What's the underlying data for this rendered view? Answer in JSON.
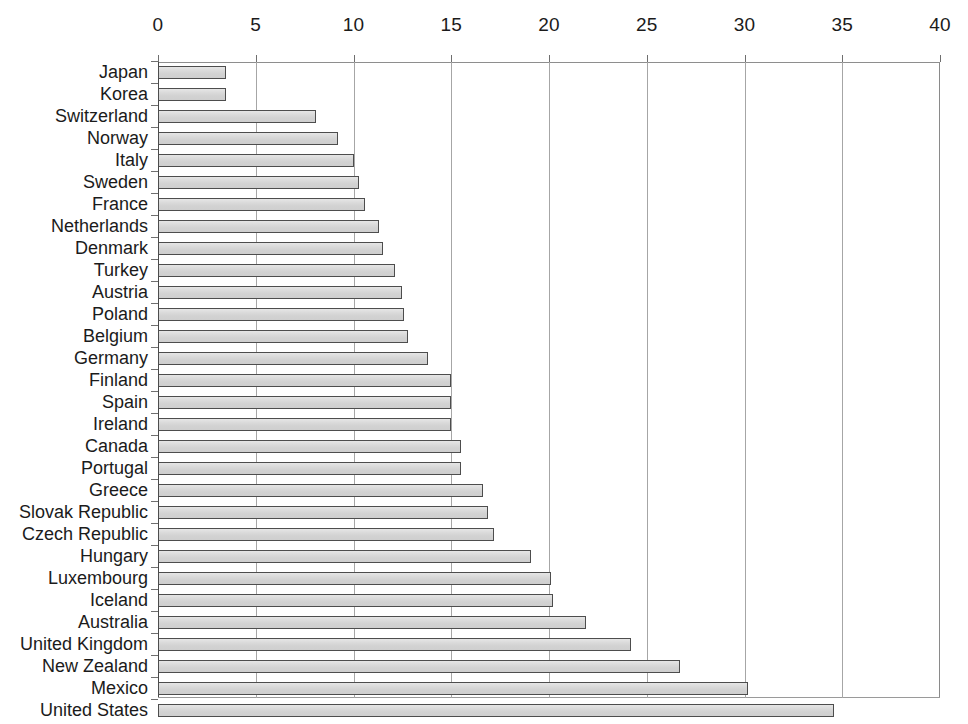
{
  "chart_data": {
    "type": "bar",
    "orientation": "horizontal",
    "title": "",
    "subtitle": "",
    "xlabel": "",
    "ylabel": "",
    "xlim": [
      0,
      40
    ],
    "ylim": null,
    "grid": true,
    "grid_axis": "x",
    "legend": false,
    "legend_position": "none",
    "xticks": [
      0,
      5,
      10,
      15,
      20,
      25,
      30,
      35,
      40
    ],
    "xtick_labels": [
      "0",
      "5",
      "10",
      "15",
      "20",
      "25",
      "30",
      "35",
      "40"
    ],
    "x_axis_position": "top",
    "categories": [
      "Japan",
      "Korea",
      "Switzerland",
      "Norway",
      "Italy",
      "Sweden",
      "France",
      "Netherlands",
      "Denmark",
      "Turkey",
      "Austria",
      "Poland",
      "Belgium",
      "Germany",
      "Finland",
      "Spain",
      "Ireland",
      "Canada",
      "Portugal",
      "Greece",
      "Slovak Republic",
      "Czech Republic",
      "Hungary",
      "Luxembourg",
      "Iceland",
      "Australia",
      "United Kingdom",
      "New Zealand",
      "Mexico",
      "United States"
    ],
    "values": [
      3.5,
      3.5,
      8.1,
      9.2,
      10.0,
      10.3,
      10.6,
      11.3,
      11.5,
      12.1,
      12.5,
      12.6,
      12.8,
      13.8,
      15.0,
      15.0,
      15.0,
      15.5,
      15.5,
      16.6,
      16.9,
      17.2,
      19.1,
      20.1,
      20.2,
      21.9,
      24.2,
      26.7,
      30.2,
      34.6
    ],
    "colors": {
      "bar_fill": "#d5d5d5",
      "bar_border": "#4d4d4d",
      "gridline": "#a6a6a6",
      "axis": "#4a4a4a",
      "text": "#1b1b1b",
      "background": "#ffffff"
    }
  }
}
